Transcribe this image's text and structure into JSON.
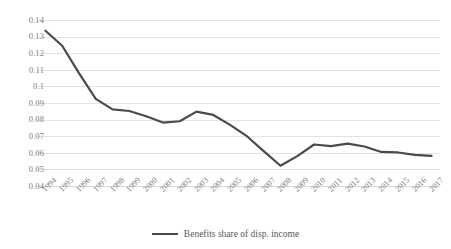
{
  "chart_data": {
    "type": "line",
    "title": "",
    "xlabel": "",
    "ylabel": "",
    "grid": true,
    "legend_position": "bottom",
    "ylim": [
      0.04,
      0.14
    ],
    "ytick_step": 0.01,
    "yticks": [
      "0.14",
      "0.13",
      "0.12",
      "0.11",
      "0.1",
      "0.09",
      "0.08",
      "0.07",
      "0.06",
      "0.05",
      "0.04"
    ],
    "categories": [
      "1994",
      "1995",
      "1996",
      "1997",
      "1998",
      "1999",
      "2000",
      "2001",
      "2002",
      "2003",
      "2004",
      "2005",
      "2006",
      "2007",
      "2008",
      "2009",
      "2010",
      "2011",
      "2012",
      "2013",
      "2014",
      "2015",
      "2016",
      "2017"
    ],
    "series": [
      {
        "name": "Benefits share of disp. income",
        "color": "#4a4a4a",
        "values": [
          0.1335,
          0.1245,
          0.108,
          0.0925,
          0.0862,
          0.0852,
          0.082,
          0.0782,
          0.079,
          0.0848,
          0.0828,
          0.0768,
          0.07,
          0.061,
          0.0522,
          0.058,
          0.065,
          0.064,
          0.0655,
          0.0638,
          0.0605,
          0.0602,
          0.0588,
          0.0582
        ]
      }
    ]
  },
  "legend": {
    "items": [
      {
        "label": "Benefits share of disp. income",
        "color": "#4a4a4a"
      }
    ]
  }
}
